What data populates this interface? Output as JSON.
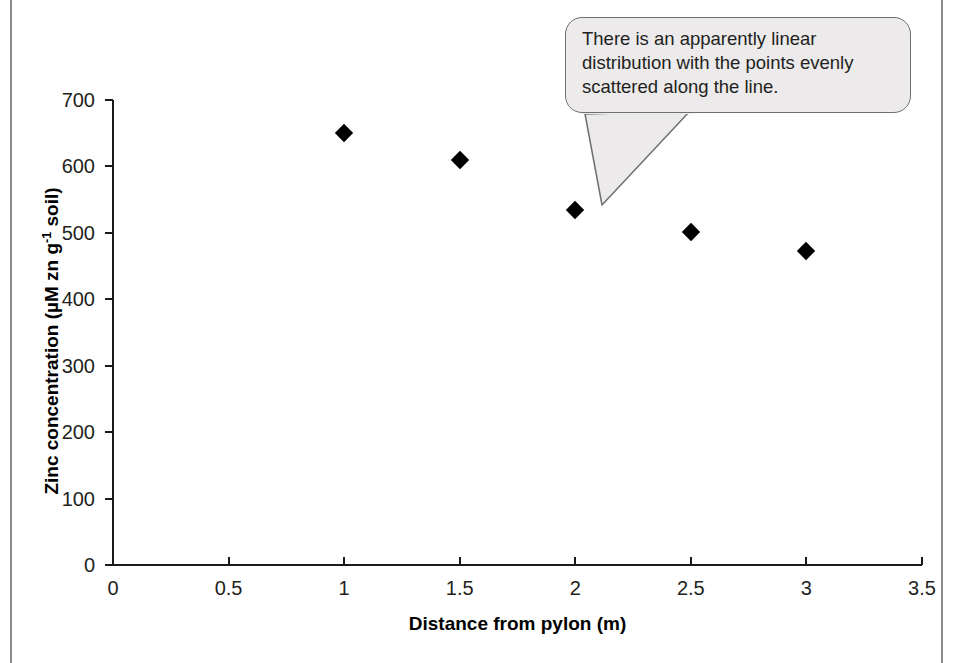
{
  "chart_data": {
    "type": "scatter",
    "title": "",
    "xlabel": "Distance from pylon (m)",
    "ylabel": "Zinc concentration (µM zn g⁻¹ soil)",
    "ylabel_parts": {
      "before": "Zinc concentration (µM zn g",
      "superscript": "-1",
      "after": " soil)"
    },
    "x": [
      1,
      1.5,
      2,
      2.5,
      3
    ],
    "values": [
      650,
      610,
      535,
      502,
      473
    ],
    "points": [
      {
        "x": 1,
        "y": 650
      },
      {
        "x": 1.5,
        "y": 610
      },
      {
        "x": 2,
        "y": 535
      },
      {
        "x": 2.5,
        "y": 502
      },
      {
        "x": 3,
        "y": 473
      }
    ],
    "xlim": [
      0,
      3.5
    ],
    "ylim": [
      0,
      700
    ],
    "xticks": [
      0,
      0.5,
      1,
      1.5,
      2,
      2.5,
      3,
      3.5
    ],
    "xtick_labels": [
      "0",
      "0.5",
      "1",
      "1.5",
      "2",
      "2.5",
      "3",
      "3.5"
    ],
    "yticks": [
      0,
      100,
      200,
      300,
      400,
      500,
      600,
      700
    ],
    "ytick_labels": [
      "0",
      "100",
      "200",
      "300",
      "400",
      "500",
      "600",
      "700"
    ],
    "grid": false,
    "legend": null,
    "marker": "filled-diamond",
    "marker_color": "#000000",
    "annotations": [
      {
        "text": "There is an apparently linear distribution with the points evenly scattered along the line.",
        "lines": [
          "There is an apparently linear",
          "distribution with the points evenly",
          "scattered along the line."
        ],
        "points_to": {
          "x": 2,
          "y": 535
        },
        "style": "rounded-speech-bubble",
        "fill": "#eceaea",
        "stroke": "#6f6f6f"
      }
    ]
  },
  "figure": {
    "background": "#ffffff",
    "axis_color": "#1a1a1a",
    "tick_text_color": "#231f20",
    "frame_rule_color": "#8c8c8c"
  }
}
